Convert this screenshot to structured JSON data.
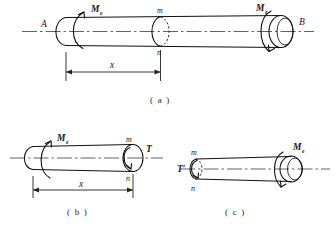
{
  "figure": {
    "background_color": "#ffffff",
    "line_color": "#111111",
    "axis_color": "#3b3b3b"
  },
  "panels": [
    {
      "id": "a",
      "caption": "( a )",
      "description": "Full shaft AB loaded by external torques Me at both ends, with section m-n at distance x from end A",
      "labels": {
        "left_end": "A",
        "right_end": "B",
        "torque_left": "M",
        "torque_left_sub": "e",
        "torque_right": "M",
        "torque_right_sub": "e",
        "section_top": "m",
        "section_bottom": "n",
        "dimension": "x"
      }
    },
    {
      "id": "b",
      "caption": "( b )",
      "description": "Left free body: segment from A to section m-n, external torque Me at left, internal torque T on cut face",
      "labels": {
        "torque_left": "M",
        "torque_left_sub": "e",
        "section_top": "m",
        "section_bottom": "n",
        "internal_torque": "T",
        "dimension": "x"
      }
    },
    {
      "id": "c",
      "caption": "( c )",
      "description": "Right free body: segment from section m-n to B, reaction internal torque T prime on cut face and external torque Me at right",
      "labels": {
        "internal_torque": "T′",
        "section_top": "m",
        "section_bottom": "n",
        "torque_right": "M",
        "torque_right_sub": "e"
      }
    }
  ]
}
